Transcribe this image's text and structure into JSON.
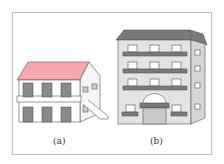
{
  "figure": {
    "panels": [
      {
        "label": "(a)",
        "subject": "two-storey house with red roof and external staircase"
      },
      {
        "label": "(b)",
        "subject": "four-storey apartment building with balconies and arched entrance"
      }
    ]
  },
  "colors": {
    "roof_a": "#f4a8ab",
    "roof_b": "#7a7a7a",
    "wall": "#ffffff",
    "wall_b": "#e3e3e3",
    "window": "#8a8a8a",
    "outline": "#555555",
    "frame": "#bdbdbd"
  }
}
